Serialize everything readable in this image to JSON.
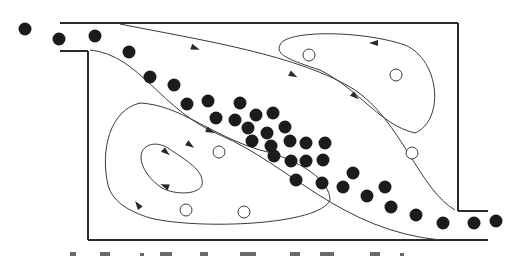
{
  "diagram": {
    "colors": {
      "wall": "#2a2a2a",
      "streamline": "#3a3a3a",
      "particle": "#1c1c1c",
      "bubble_fill": "#ffffff",
      "background": "#ffffff"
    },
    "channel": {
      "inlet": {
        "top_y": 23,
        "bottom_y": 50,
        "x_start": 60,
        "x_wall": 88
      },
      "outlet": {
        "top_y": 212,
        "bottom_y": 240,
        "x_wall": 458,
        "x_end": 488
      },
      "box": {
        "left": 88,
        "top": 23,
        "right": 458,
        "bottom": 240
      }
    },
    "particles": [
      [
        25,
        29
      ],
      [
        59,
        39
      ],
      [
        95,
        36
      ],
      [
        129,
        52
      ],
      [
        150,
        77
      ],
      [
        174,
        85
      ],
      [
        187,
        104
      ],
      [
        208,
        101
      ],
      [
        240,
        103
      ],
      [
        216,
        118
      ],
      [
        235,
        120
      ],
      [
        256,
        115
      ],
      [
        273,
        113
      ],
      [
        248,
        128
      ],
      [
        267,
        133
      ],
      [
        285,
        127
      ],
      [
        252,
        141
      ],
      [
        271,
        146
      ],
      [
        290,
        141
      ],
      [
        306,
        143
      ],
      [
        325,
        143
      ],
      [
        274,
        156
      ],
      [
        291,
        161
      ],
      [
        306,
        161
      ],
      [
        323,
        160
      ],
      [
        296,
        180
      ],
      [
        322,
        183
      ],
      [
        343,
        187
      ],
      [
        353,
        173
      ],
      [
        367,
        196
      ],
      [
        385,
        187
      ],
      [
        391,
        207
      ],
      [
        416,
        215
      ],
      [
        443,
        223
      ],
      [
        474,
        223
      ],
      [
        496,
        221
      ]
    ],
    "bubbles": [
      [
        309,
        55
      ],
      [
        396,
        75
      ],
      [
        219,
        152
      ],
      [
        412,
        153
      ],
      [
        186,
        210
      ],
      [
        244,
        212
      ]
    ],
    "streamlines": [
      {
        "name": "upper-main",
        "d": "M 120 24 C 200 40, 300 55, 355 90 C 400 120, 420 190, 455 210"
      },
      {
        "name": "lower-main",
        "d": "M 90 50 C 140 55, 160 110, 220 135 C 290 165, 340 230, 440 240"
      },
      {
        "name": "upper-right-vortex",
        "d": "M 280 45 C 285 30, 360 30, 405 45 C 440 60, 445 120, 415 133 C 380 125, 360 90, 320 70 C 290 60, 275 55, 280 45 Z"
      },
      {
        "name": "lower-left-outer-vortex",
        "d": "M 108 185 C 100 150, 110 110, 140 103 C 180 105, 210 135, 260 150 C 300 160, 330 180, 330 200 C 320 225, 200 230, 150 218 C 125 210, 112 200, 108 185 Z"
      },
      {
        "name": "lower-left-inner-vortex",
        "d": "M 141 157 C 141 145, 155 140, 168 148 C 185 160, 205 170, 202 185 C 198 195, 175 195, 162 188 C 150 180, 141 168, 141 157 Z"
      }
    ],
    "arrows": [
      {
        "x": 195,
        "y": 48,
        "angle": 20
      },
      {
        "x": 374,
        "y": 43,
        "angle": 180
      },
      {
        "x": 355,
        "y": 96,
        "angle": 40
      },
      {
        "x": 293,
        "y": 75,
        "angle": 28
      },
      {
        "x": 210,
        "y": 131,
        "angle": 25
      },
      {
        "x": 190,
        "y": 145,
        "angle": 35
      },
      {
        "x": 166,
        "y": 152,
        "angle": 40
      },
      {
        "x": 165,
        "y": 186,
        "angle": 200
      },
      {
        "x": 138,
        "y": 205,
        "angle": 235
      }
    ],
    "caption": {
      "note": "caption text below the figure is clipped; only top fragments of characters visible"
    }
  }
}
